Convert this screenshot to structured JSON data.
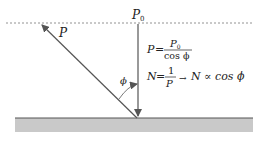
{
  "diagram": {
    "labels": {
      "p0": "P",
      "p0_sub": "0",
      "p": "P",
      "phi": "ϕ"
    },
    "equations": {
      "eq1_lhs": "P",
      "eq1_eq": "=",
      "eq1_num": "P",
      "eq1_num_sub": "0",
      "eq1_den": "cos ϕ",
      "eq2_lhs": "N",
      "eq2_eq": "=",
      "eq2_num": "1",
      "eq2_den": "P",
      "eq2_arrow": "→",
      "eq2_rhs": "N ∝ cos ϕ"
    },
    "colors": {
      "line": "#555555",
      "ground": "#c8c8c8",
      "dotted": "#777777"
    }
  }
}
